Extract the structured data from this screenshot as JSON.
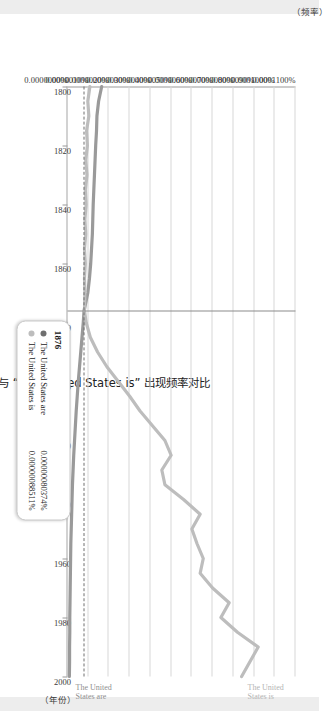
{
  "chart_data": {
    "type": "line",
    "title": "书籍中 “The United States are” 与 “The United States is” 出现频率对比",
    "xlabel": "（年份）",
    "ylabel": "（频率）",
    "xlim": [
      1800,
      2000
    ],
    "ylim": [
      0.0,
      0.00011
    ],
    "grid": true,
    "legend_position": "inline-right",
    "xticks": [
      "1800",
      "1820",
      "1840",
      "1860",
      "1880",
      "1900",
      "1920",
      "1940",
      "1960",
      "1980",
      "2000"
    ],
    "yticks": [
      "0.0000000%",
      "0.0000010%",
      "0.0000020%",
      "0.0000030%",
      "0.0000040%",
      "0.0000050%",
      "0.0000060%",
      "0.0000070%",
      "0.0000080%",
      "0.0000090%",
      "0.0001000%",
      "0.0001100%"
    ],
    "ytick_values": [
      0,
      1e-05,
      2e-05,
      3e-05,
      4e-05,
      5e-05,
      6e-05,
      7e-05,
      8e-05,
      9e-05,
      0.0001,
      0.00011
    ],
    "series": [
      {
        "name": "The United States are",
        "color": "#9a9a9a",
        "end_label": "The United States are",
        "x": [
          1800,
          1805,
          1810,
          1815,
          1820,
          1825,
          1830,
          1835,
          1840,
          1845,
          1850,
          1855,
          1860,
          1865,
          1870,
          1876,
          1880,
          1885,
          1890,
          1895,
          1900,
          1905,
          1910,
          1915,
          1920,
          1925,
          1930,
          1935,
          1940,
          1945,
          1950,
          1955,
          1960,
          1965,
          1970,
          1975,
          1980,
          1985,
          1990,
          1995,
          2000
        ],
        "values": [
          1.65e-05,
          1.5e-05,
          1.42e-05,
          1.4e-05,
          1.36e-05,
          1.33e-05,
          1.3e-05,
          1.27e-05,
          1.24e-05,
          1.22e-05,
          1.2e-05,
          1.16e-05,
          1.12e-05,
          1.06e-05,
          9.8e-06,
          8e-06,
          7.6e-06,
          7e-06,
          6.4e-06,
          5.8e-06,
          5.2e-06,
          4.7e-06,
          4.2e-06,
          3.8e-06,
          3.4e-06,
          3e-06,
          2.7e-06,
          2.4e-06,
          2.2e-06,
          2e-06,
          1.8e-06,
          1.6e-06,
          1.5e-06,
          1.4e-06,
          1.3e-06,
          1.2e-06,
          1.1e-06,
          1.1e-06,
          1e-06,
          1e-06,
          9e-07
        ]
      },
      {
        "name": "The United States is",
        "color": "#bdbdbd",
        "end_label": "The United States is",
        "x": [
          1800,
          1805,
          1810,
          1815,
          1820,
          1825,
          1830,
          1835,
          1840,
          1845,
          1850,
          1855,
          1860,
          1865,
          1870,
          1876,
          1880,
          1885,
          1890,
          1895,
          1900,
          1905,
          1910,
          1915,
          1920,
          1925,
          1930,
          1935,
          1940,
          1945,
          1950,
          1955,
          1960,
          1965,
          1970,
          1975,
          1980,
          1985,
          1990,
          1995,
          2000
        ],
        "values": [
          1.08e-05,
          9.8e-06,
          1.03e-05,
          9.2e-06,
          9.6e-06,
          8.8e-06,
          9.4e-06,
          8.6e-06,
          9e-06,
          8.4e-06,
          8.8e-06,
          8.2e-06,
          8.6e-06,
          8.2e-06,
          8.4e-06,
          8.2e-06,
          9e-06,
          1.1e-05,
          1.45e-05,
          1.9e-05,
          2.45e-05,
          3e-05,
          3.5e-05,
          4.1e-05,
          4.7e-05,
          5e-05,
          4.55e-05,
          4.7e-05,
          5.6e-05,
          6.4e-05,
          6e-05,
          6.25e-05,
          6.55e-05,
          6.4e-05,
          7e-05,
          7.8e-05,
          7.4e-05,
          8.2e-05,
          9.2e-05,
          8.8e-05,
          8.4e-05
        ]
      }
    ],
    "hover": {
      "year": "1876",
      "rows": [
        {
          "label": "The United States are",
          "value": "0.00000080374%",
          "color": "#6f6f6f"
        },
        {
          "label": "The United States is",
          "value": "0.00000088511%",
          "color": "#bdbdbd"
        }
      ]
    }
  }
}
